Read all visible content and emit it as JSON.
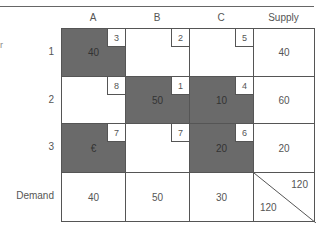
{
  "table": {
    "columns": [
      "A",
      "B",
      "C",
      "Supply"
    ],
    "rows": [
      "1",
      "2",
      "3",
      "Demand"
    ],
    "side_mark": "r",
    "cells": [
      [
        {
          "cost": "3",
          "alloc": "40",
          "basic": true
        },
        {
          "cost": "2",
          "alloc": "",
          "basic": false
        },
        {
          "cost": "5",
          "alloc": "",
          "basic": false
        }
      ],
      [
        {
          "cost": "8",
          "alloc": "",
          "basic": false
        },
        {
          "cost": "1",
          "alloc": "50",
          "basic": true
        },
        {
          "cost": "4",
          "alloc": "10",
          "basic": true
        }
      ],
      [
        {
          "cost": "7",
          "alloc": "€",
          "basic": true
        },
        {
          "cost": "7",
          "alloc": "",
          "basic": false
        },
        {
          "cost": "6",
          "alloc": "20",
          "basic": true
        }
      ]
    ],
    "supply": [
      "40",
      "60",
      "20"
    ],
    "demand": [
      "40",
      "50",
      "30"
    ],
    "total_supply": "120",
    "total_demand": "120"
  },
  "colors": {
    "basic_cell": "#6a6a6a",
    "border": "#555555"
  }
}
